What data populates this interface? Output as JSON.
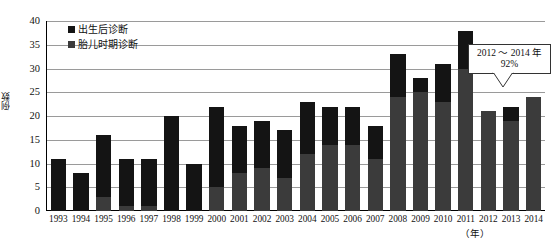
{
  "chart_data": {
    "type": "bar",
    "stacked": true,
    "title": "",
    "xlabel": "（年）",
    "ylabel": "例数",
    "ylim": [
      0,
      40
    ],
    "ytick_step": 5,
    "yticks": [
      "0",
      "5",
      "10",
      "15",
      "20",
      "25",
      "30",
      "35",
      "40"
    ],
    "grid": true,
    "legend_position": "top-left",
    "categories": [
      "1993",
      "1994",
      "1995",
      "1996",
      "1997",
      "1998",
      "1999",
      "2000",
      "2001",
      "2002",
      "2003",
      "2004",
      "2005",
      "2006",
      "2007",
      "2008",
      "2009",
      "2010",
      "2011",
      "2012",
      "2013",
      "2014"
    ],
    "series": [
      {
        "name": "胎儿时期诊断",
        "color": "#3b3b3b",
        "values": [
          0,
          0,
          3,
          1,
          1,
          0,
          0,
          5,
          8,
          9,
          7,
          12,
          14,
          14,
          11,
          24,
          25,
          23,
          30,
          21,
          19,
          24
        ]
      },
      {
        "name": "出生后诊断",
        "color": "#141414",
        "values": [
          11,
          8,
          13,
          10,
          10,
          20,
          10,
          17,
          10,
          10,
          10,
          11,
          8,
          8,
          7,
          9,
          3,
          8,
          8,
          0,
          3,
          0
        ]
      }
    ],
    "totals": [
      11,
      8,
      16,
      11,
      11,
      20,
      10,
      22,
      18,
      19,
      17,
      23,
      22,
      22,
      18,
      33,
      28,
      31,
      38,
      21,
      22,
      24
    ],
    "annotations": [
      {
        "name": "fetal-rate-callout",
        "line1": "2012 ～ 2014 年",
        "line2": "92%",
        "points_to": "2014"
      }
    ]
  },
  "legend": {
    "items": [
      {
        "label": "出生后诊断",
        "color": "#141414"
      },
      {
        "label": "胎儿时期诊断",
        "color": "#3b3b3b"
      }
    ]
  },
  "axes": {
    "y_title": "例数",
    "x_title": "（年）"
  }
}
